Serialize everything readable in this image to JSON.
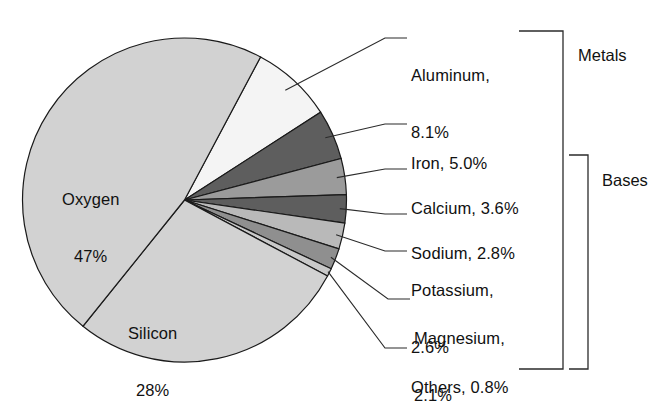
{
  "chart_data": {
    "type": "pie",
    "title": "",
    "subtitle": "",
    "xlabel": "",
    "ylabel": "",
    "legend_position": "right-callouts",
    "grid": false,
    "units": "percent",
    "categories": [
      "Oxygen",
      "Silicon",
      "Aluminum",
      "Iron",
      "Calcium",
      "Sodium",
      "Potassium",
      "Magnesium",
      "Others"
    ],
    "values": [
      47,
      28,
      8.1,
      5.0,
      3.6,
      2.8,
      2.6,
      2.1,
      0.8
    ],
    "slices": [
      {
        "name": "Oxygen",
        "value": 47,
        "label": "Oxygen",
        "value_label": "47%",
        "color": "#d2d2d2",
        "placement": "inside"
      },
      {
        "name": "Silicon",
        "value": 28,
        "label": "Silicon",
        "value_label": "28%",
        "color": "#d2d2d2",
        "placement": "inside"
      },
      {
        "name": "Aluminum",
        "value": 8.1,
        "label": "Aluminum,",
        "value_label": "8.1%",
        "color": "#f4f4f4",
        "placement": "callout",
        "group": "Metals"
      },
      {
        "name": "Iron",
        "value": 5.0,
        "label": "Iron, 5.0%",
        "value_label": "5.0%",
        "color": "#5e5e5e",
        "placement": "callout",
        "group": "Metals"
      },
      {
        "name": "Calcium",
        "value": 3.6,
        "label": "Calcium, 3.6%",
        "value_label": "3.6%",
        "color": "#9b9b9b",
        "placement": "callout",
        "group": "Bases"
      },
      {
        "name": "Sodium",
        "value": 2.8,
        "label": "Sodium, 2.8%",
        "value_label": "2.8%",
        "color": "#5e5e5e",
        "placement": "callout",
        "group": "Bases"
      },
      {
        "name": "Potassium",
        "value": 2.6,
        "label": "Potassium,",
        "value_label": "2.6%",
        "color": "#b9b9b9",
        "placement": "callout",
        "group": "Bases"
      },
      {
        "name": "Magnesium",
        "value": 2.1,
        "label": "Magnesium,",
        "value_label": "2.1%",
        "color": "#8f8f8f",
        "placement": "callout",
        "group": "Bases"
      },
      {
        "name": "Others",
        "value": 0.8,
        "label": "Others, 0.8%",
        "value_label": "0.8%",
        "color": "#c9c9c9",
        "placement": "callout",
        "group": "Bases"
      }
    ]
  },
  "callouts": [
    {
      "key": "aluminum",
      "line1": "Aluminum,",
      "line2": "8.1%"
    },
    {
      "key": "iron",
      "line1": "Iron, 5.0%",
      "line2": ""
    },
    {
      "key": "calcium",
      "line1": "Calcium, 3.6%",
      "line2": ""
    },
    {
      "key": "sodium",
      "line1": "Sodium, 2.8%",
      "line2": ""
    },
    {
      "key": "potassium",
      "line1": "Potassium,",
      "line2": "2.6%"
    },
    {
      "key": "magnesium",
      "line1": "Magnesium,",
      "line2": "2.1%"
    },
    {
      "key": "others",
      "line1": "Others, 0.8%",
      "line2": ""
    }
  ],
  "inside_labels": {
    "oxygen_name": "Oxygen",
    "oxygen_value": "47%",
    "silicon_name": "Silicon",
    "silicon_value": "28%"
  },
  "groups": {
    "metals": "Metals",
    "bases": "Bases"
  },
  "colors": {
    "stroke": "#1a1a1a",
    "text": "#111111",
    "background": "#ffffff",
    "leader": "#2b2b2b"
  }
}
